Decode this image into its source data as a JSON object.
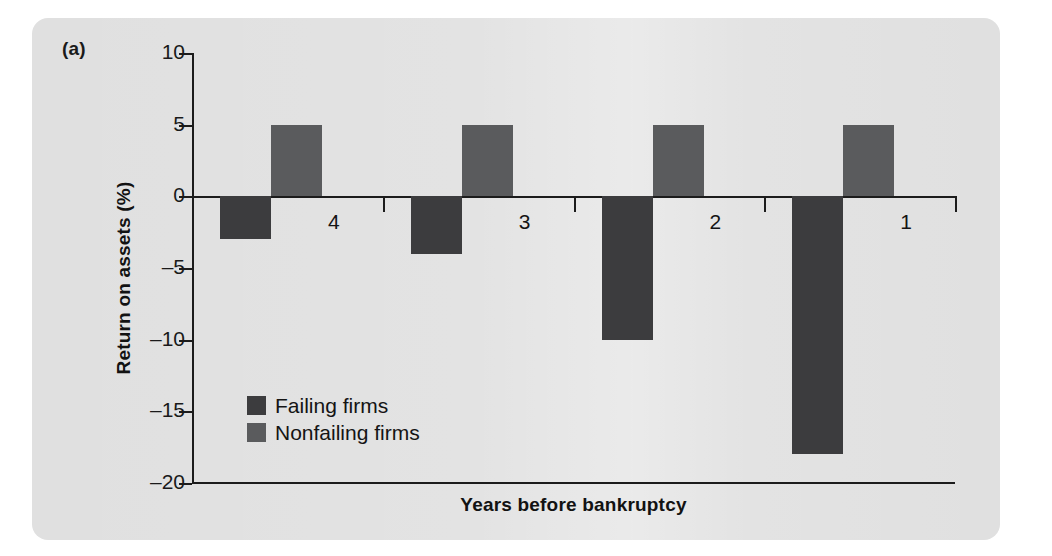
{
  "figure": {
    "panel_label": "(a)"
  },
  "chart_data": {
    "type": "bar",
    "title": "",
    "xlabel": "Years before bankruptcy",
    "ylabel": "Return on assets (%)",
    "categories": [
      "4",
      "3",
      "2",
      "1"
    ],
    "series": [
      {
        "name": "Failing firms",
        "color": "#3c3c3e",
        "values": [
          -3,
          -4,
          -10,
          -18
        ]
      },
      {
        "name": "Nonfailing firms",
        "color": "#5a5b5d",
        "values": [
          5,
          5,
          5,
          5
        ]
      }
    ],
    "ylim": [
      -20,
      10
    ],
    "yticks": [
      10,
      5,
      0,
      -5,
      -10,
      -15,
      -20
    ],
    "ytick_labels": [
      "10",
      "5",
      "0",
      "–5",
      "–10",
      "–15",
      "–20"
    ],
    "grid": false,
    "legend_position": "inside-lower-left",
    "legend": [
      {
        "label": "Failing firms",
        "color": "#3c3c3e"
      },
      {
        "label": "Nonfailing firms",
        "color": "#5a5b5d"
      }
    ]
  }
}
